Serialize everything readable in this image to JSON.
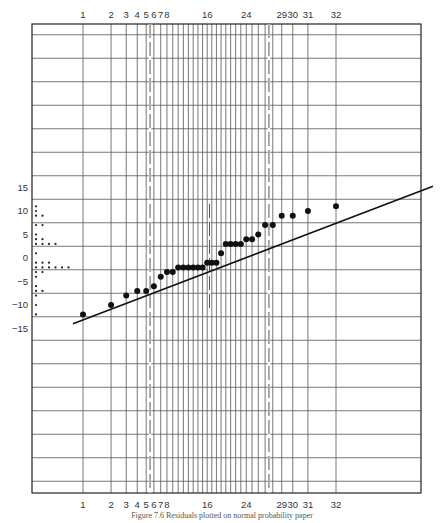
{
  "chart_data": {
    "type": "scatter",
    "title": "",
    "caption": "Figure 7.6  Residuals plotted on normal probability paper",
    "xlabel": "Rank (1–32)",
    "ylabel": "Residual",
    "ylim": [
      -20,
      20
    ],
    "yticks": [
      15,
      10,
      5,
      0,
      -5,
      -10,
      -15
    ],
    "xticks_top": [
      "1",
      "2",
      "3",
      "4",
      "5",
      "6",
      "7",
      "8",
      "16",
      "24",
      "29",
      "30",
      "31",
      "32"
    ],
    "xticks_bottom": [
      "1",
      "2",
      "3",
      "4",
      "5",
      "6",
      "7",
      "8",
      "16",
      "24",
      "29",
      "30",
      "31",
      "32"
    ],
    "grid": true,
    "rank": [
      1,
      2,
      3,
      4,
      5,
      6,
      7,
      8,
      9,
      10,
      11,
      12,
      13,
      14,
      15,
      16,
      17,
      18,
      19,
      20,
      21,
      22,
      23,
      24,
      25,
      26,
      27,
      28,
      29,
      30,
      31,
      32
    ],
    "residuals": [
      -12,
      -10,
      -8,
      -7,
      -7,
      -6,
      -4,
      -3,
      -3,
      -2,
      -2,
      -2,
      -2,
      -2,
      -2,
      -1,
      -1,
      -1,
      1,
      3,
      3,
      3,
      3,
      4,
      4,
      5,
      7,
      7,
      9,
      9,
      10,
      11
    ],
    "fitted_line": {
      "from": [
        0.5,
        -14
      ],
      "to": [
        32.5,
        14
      ]
    },
    "dot_plot_left": {
      "description": "Dot diagram of residuals along y-axis",
      "values": [
        11,
        10,
        9,
        9,
        7,
        7,
        5,
        4,
        4,
        3,
        3,
        3,
        3,
        1,
        -1,
        -1,
        -1,
        -2,
        -2,
        -2,
        -2,
        -2,
        -2,
        -3,
        -3,
        -4,
        -6,
        -7,
        -7,
        -8,
        -10,
        -12
      ]
    },
    "dashed_verticals_at_rank": [
      5.5,
      27.5
    ],
    "short_dashed_marker_at_rank": 16
  }
}
